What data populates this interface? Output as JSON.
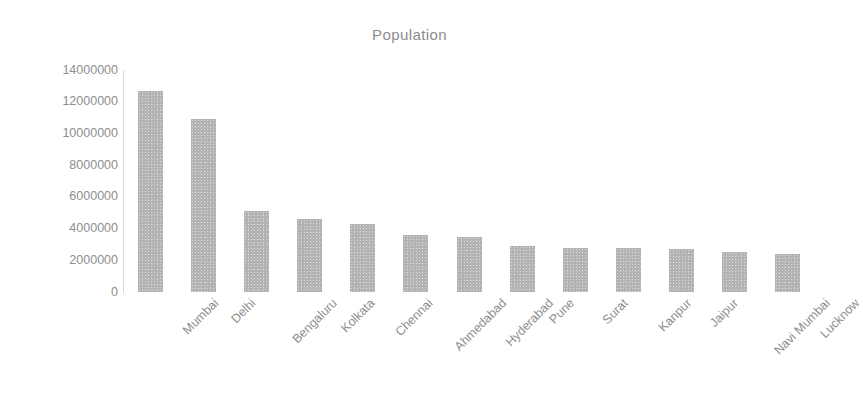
{
  "chart_data": {
    "type": "bar",
    "title": "Population",
    "xlabel": "",
    "ylabel": "",
    "categories": [
      "Mumbai",
      "Delhi",
      "Bengaluru",
      "Kolkata",
      "Chennai",
      "Ahmedabad",
      "Hyderabad",
      "Pune",
      "Surat",
      "Kanpur",
      "Jaipur",
      "Navi Mumbai",
      "Lucknow"
    ],
    "values": [
      12700000,
      10900000,
      5100000,
      4600000,
      4300000,
      3600000,
      3500000,
      2900000,
      2800000,
      2800000,
      2700000,
      2500000,
      2400000
    ],
    "ylim": [
      0,
      14000000
    ],
    "ytick_labels": [
      "14000000",
      "12000000",
      "10000000",
      "8000000",
      "6000000",
      "4000000",
      "2000000",
      "0"
    ],
    "ytick_values": [
      14000000,
      12000000,
      10000000,
      8000000,
      6000000,
      4000000,
      2000000,
      0
    ],
    "grid": false,
    "legend": "none",
    "series": [
      {
        "name": "Population",
        "values": [
          12700000,
          10900000,
          5100000,
          4600000,
          4300000,
          3600000,
          3500000,
          2900000,
          2800000,
          2800000,
          2700000,
          2500000,
          2400000
        ]
      }
    ],
    "colors": {
      "bar": "#b2b2b2",
      "axis": "#d9d9d9",
      "text": "#8e8e8e",
      "title": "#8c8c8c",
      "background": "#ffffff"
    },
    "xtick_rotation_degrees": -45
  }
}
